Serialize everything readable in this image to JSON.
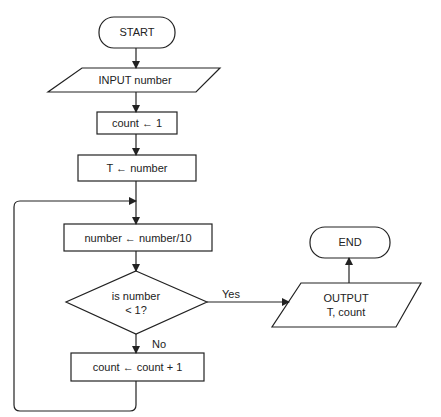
{
  "flowchart": {
    "start": "START",
    "input": "INPUT number",
    "step1": "count ← 1",
    "step2": "T ← number",
    "step3": "number ← number/10",
    "decision_line1": "is number",
    "decision_line2": "< 1?",
    "yes_label": "Yes",
    "no_label": "No",
    "step4": "count ← count + 1",
    "output_line1": "OUTPUT",
    "output_line2": "T, count",
    "end": "END"
  },
  "colors": {
    "stroke": "#222222",
    "background": "#ffffff"
  }
}
